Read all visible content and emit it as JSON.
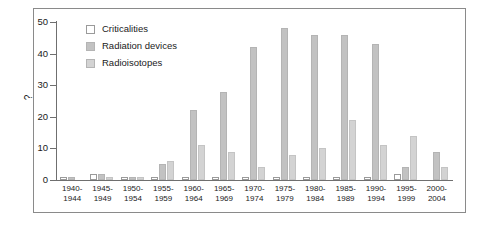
{
  "chart_data": {
    "type": "bar",
    "title": "",
    "xlabel": "",
    "ylabel": "?",
    "ylim": [
      0,
      50
    ],
    "yticks": [
      0,
      10,
      20,
      30,
      40,
      50
    ],
    "grid": false,
    "legend_position": "top-left",
    "categories": [
      "1940-1944",
      "1945-1949",
      "1950-1954",
      "1955-1959",
      "1960-1964",
      "1965-1969",
      "1970-1974",
      "1975-1979",
      "1980-1984",
      "1985-1989",
      "1990-1994",
      "1995-1999",
      "2000-2004"
    ],
    "categories_lines": [
      [
        "1940-",
        "1944"
      ],
      [
        "1945-",
        "1949"
      ],
      [
        "1950-",
        "1954"
      ],
      [
        "1955-",
        "1959"
      ],
      [
        "1960-",
        "1964"
      ],
      [
        "1965-",
        "1969"
      ],
      [
        "1970-",
        "1974"
      ],
      [
        "1975-",
        "1979"
      ],
      [
        "1980-",
        "1984"
      ],
      [
        "1985-",
        "1989"
      ],
      [
        "1990-",
        "1994"
      ],
      [
        "1995-",
        "1999"
      ],
      [
        "2000-",
        "2004"
      ]
    ],
    "series": [
      {
        "name": "Criticalities",
        "color": "#ffffff",
        "values": [
          1,
          2,
          1,
          1,
          1,
          1,
          1,
          1,
          1,
          1,
          1,
          2,
          0
        ]
      },
      {
        "name": "Radiation devices",
        "color": "#c2c2c2",
        "values": [
          1,
          2,
          1,
          5,
          22,
          28,
          42,
          48,
          46,
          46,
          43,
          4,
          9
        ]
      },
      {
        "name": "Radioisotopes",
        "color": "#d3d3d3",
        "values": [
          0,
          1,
          1,
          6,
          11,
          9,
          4,
          8,
          10,
          19,
          11,
          14,
          4
        ]
      }
    ]
  },
  "legend": {
    "items": [
      {
        "label": "Criticalities",
        "swatch": "#ffffff"
      },
      {
        "label": "Radiation devices",
        "swatch": "#c2c2c2"
      },
      {
        "label": "Radioisotopes",
        "swatch": "#d3d3d3"
      }
    ]
  },
  "axis": {
    "y_labels": [
      "50",
      "40",
      "30",
      "20",
      "10",
      "0"
    ],
    "y_title": "?"
  }
}
